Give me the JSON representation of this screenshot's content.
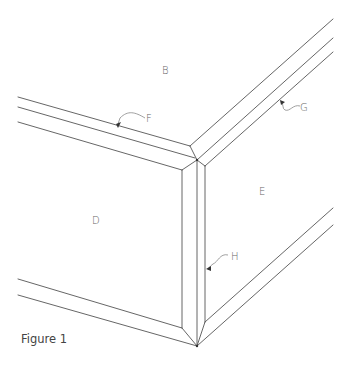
{
  "figure": {
    "caption": "Figure 1"
  },
  "labels": {
    "B": "B",
    "D": "D",
    "E": "E",
    "F": "F",
    "G": "G",
    "H": "H"
  },
  "colors": {
    "line": "#555555",
    "label": "#666666",
    "background": "#ffffff"
  }
}
